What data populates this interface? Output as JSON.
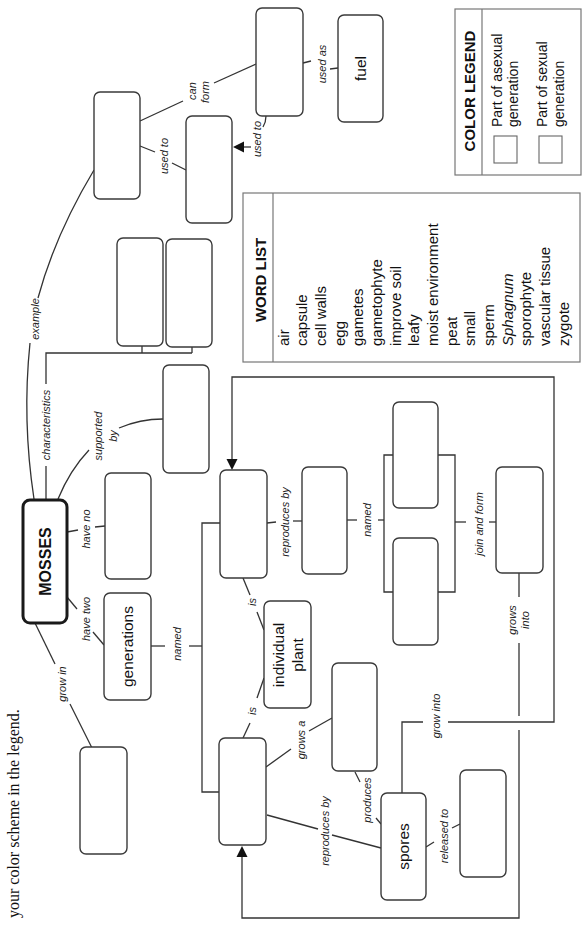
{
  "footer_text": "your color scheme in the legend.",
  "central_concept": "MOSSES",
  "nodes": {
    "generations": "generations",
    "individual_plant_line1": "individual",
    "individual_plant_line2": "plant",
    "spores": "spores",
    "fuel": "fuel",
    "blank_boxes": [
      "example",
      "used-to-target",
      "can-form-target",
      "characteristic-1",
      "characteristic-2",
      "supported-by-target",
      "have-no-target",
      "grow-in-target",
      "gametophyte-generation",
      "sporophyte-generation",
      "gametes-target",
      "gamete-1",
      "gamete-2",
      "zygote-target",
      "grows-a-target",
      "released-to-target"
    ]
  },
  "links": {
    "can_form_line1": "can",
    "can_form_line2": "form",
    "used_to_a": "used to",
    "used_to_b": "used to",
    "used_as": "used as",
    "example": "example",
    "characteristics": "characteristics",
    "supported_by_line1": "supported",
    "supported_by_line2": "by",
    "have_no": "have no",
    "have_two": "have two",
    "grow_in": "grow in",
    "named_a": "named",
    "is_a": "is",
    "is_b": "is",
    "reproduces_by_a": "reproduces by",
    "named_b": "named",
    "join_and_form": "join and form",
    "grows_into_line1": "grows",
    "grows_into_line2": "into",
    "grow_into": "grow into",
    "grows_a": "grows a",
    "produces": "produces",
    "reproduces_by_b": "reproduces by",
    "released_to": "released to"
  },
  "word_list": {
    "title": "WORD LIST",
    "words": [
      {
        "text": "air",
        "italic": false
      },
      {
        "text": "capsule",
        "italic": false
      },
      {
        "text": "cell walls",
        "italic": false
      },
      {
        "text": "egg",
        "italic": false
      },
      {
        "text": "gametes",
        "italic": false
      },
      {
        "text": "gametophyte",
        "italic": false
      },
      {
        "text": "improve soil",
        "italic": false
      },
      {
        "text": "leafy",
        "italic": false
      },
      {
        "text": "moist environment",
        "italic": false
      },
      {
        "text": "peat",
        "italic": false
      },
      {
        "text": "small",
        "italic": false
      },
      {
        "text": "sperm",
        "italic": false
      },
      {
        "text": "Sphagnum",
        "italic": true
      },
      {
        "text": "sporophyte",
        "italic": false
      },
      {
        "text": "vascular tissue",
        "italic": false
      },
      {
        "text": "zygote",
        "italic": false
      }
    ]
  },
  "color_legend": {
    "title": "COLOR LEGEND",
    "items": [
      {
        "line1": "Part of asexual",
        "line2": "generation"
      },
      {
        "line1": "Part of sexual",
        "line2": "generation"
      }
    ]
  },
  "colors": {
    "stroke": "#333333",
    "background": "#ffffff"
  }
}
